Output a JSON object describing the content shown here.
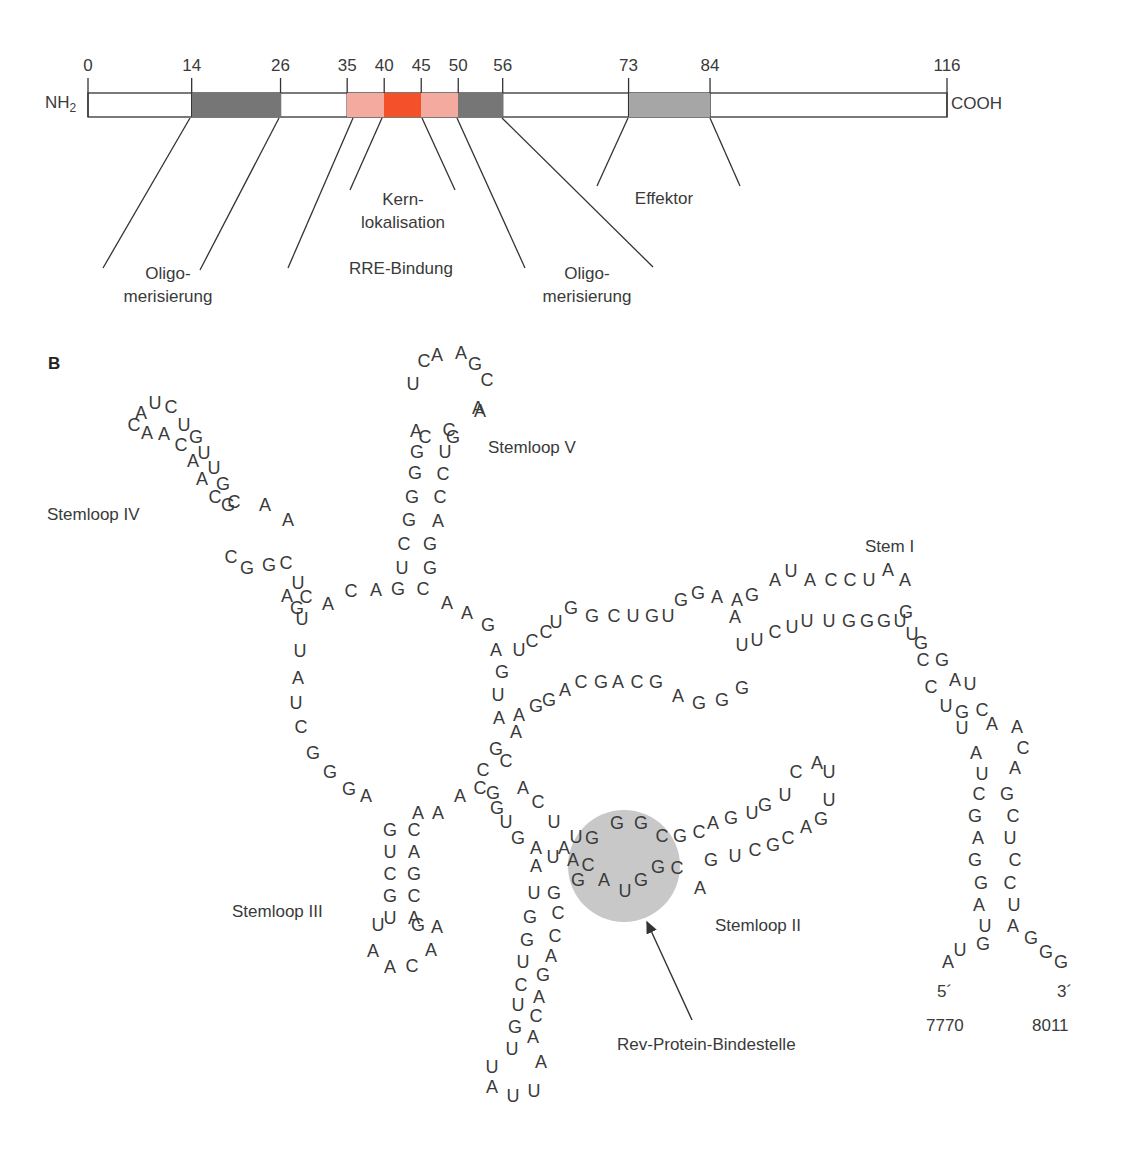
{
  "panelA": {
    "n_terminus": "NH",
    "n_terminus_sub": "2",
    "c_terminus": "COOH",
    "scale": {
      "x0": 88,
      "x116": 947,
      "max": 116
    },
    "ticks": [
      {
        "value": "0",
        "pos": 0
      },
      {
        "value": "14",
        "pos": 14
      },
      {
        "value": "26",
        "pos": 26
      },
      {
        "value": "35",
        "pos": 35
      },
      {
        "value": "40",
        "pos": 40
      },
      {
        "value": "45",
        "pos": 45
      },
      {
        "value": "50",
        "pos": 50
      },
      {
        "value": "56",
        "pos": 56
      },
      {
        "value": "73",
        "pos": 73
      },
      {
        "value": "84",
        "pos": 84
      },
      {
        "value": "116",
        "pos": 116
      }
    ],
    "segments": [
      {
        "name": "oligomerization-1",
        "start": 14,
        "end": 26,
        "color": "#767676"
      },
      {
        "name": "rre-binding-left",
        "start": 35,
        "end": 40,
        "color": "#f5aaa0"
      },
      {
        "name": "nuclear-localization",
        "start": 40,
        "end": 45,
        "color": "#f4502a"
      },
      {
        "name": "rre-binding-right",
        "start": 45,
        "end": 50,
        "color": "#f5aaa0"
      },
      {
        "name": "oligomerization-2",
        "start": 50,
        "end": 56,
        "color": "#767676"
      },
      {
        "name": "effector",
        "start": 73,
        "end": 84,
        "color": "#a6a6a6"
      }
    ],
    "labels": [
      {
        "id": "oligo1",
        "line1": "Oligo-",
        "line2": "merisierung",
        "x": 168,
        "y": 262
      },
      {
        "id": "kern",
        "line1": "Kern-",
        "line2": "lokalisation",
        "x": 403,
        "y": 188
      },
      {
        "id": "rre",
        "line1": "RRE-Bindung",
        "line2": "",
        "x": 401,
        "y": 257
      },
      {
        "id": "oligo2",
        "line1": "Oligo-",
        "line2": "merisierung",
        "x": 587,
        "y": 262
      },
      {
        "id": "effektor",
        "line1": "Effektor",
        "line2": "",
        "x": 664,
        "y": 187
      }
    ],
    "leader_lines": [
      [
        190,
        118,
        103,
        268
      ],
      [
        279,
        118,
        200,
        270
      ],
      [
        353,
        118,
        288,
        268
      ],
      [
        382,
        118,
        350,
        190
      ],
      [
        422,
        118,
        455,
        190
      ],
      [
        457,
        118,
        525,
        268
      ],
      [
        502,
        118,
        653,
        267
      ],
      [
        628,
        118,
        597,
        186
      ],
      [
        710,
        118,
        740,
        186
      ]
    ]
  },
  "panelB": {
    "letter": "B",
    "labels": [
      {
        "text": "Stemloop IV",
        "x": 47,
        "y": 505
      },
      {
        "text": "Stemloop V",
        "x": 488,
        "y": 438
      },
      {
        "text": "Stem I",
        "x": 865,
        "y": 537
      },
      {
        "text": "Stemloop III",
        "x": 232,
        "y": 902
      },
      {
        "text": "Stemloop II",
        "x": 715,
        "y": 916
      },
      {
        "text": "Rev-Protein-Bindestelle",
        "x": 617,
        "y": 1035
      },
      {
        "text": "5´",
        "x": 937,
        "y": 982
      },
      {
        "text": "3´",
        "x": 1057,
        "y": 982
      },
      {
        "text": "7770",
        "x": 926,
        "y": 1016
      },
      {
        "text": "8011",
        "x": 1032,
        "y": 1016
      }
    ],
    "binding_site": {
      "cx": 624,
      "cy": 866,
      "r": 56,
      "color": "#c8c8c8"
    },
    "arrow": {
      "x1": 692,
      "y1": 1020,
      "x2": 647,
      "y2": 922
    },
    "nucleotides": [
      [
        "A",
        141,
        413
      ],
      [
        "U",
        155,
        403
      ],
      [
        "C",
        171,
        407
      ],
      [
        "C",
        134,
        425
      ],
      [
        "A",
        147,
        433
      ],
      [
        "A",
        164,
        434
      ],
      [
        "U",
        184,
        425
      ],
      [
        "C",
        181,
        445
      ],
      [
        "G",
        196,
        437
      ],
      [
        "A",
        193,
        461
      ],
      [
        "U",
        204,
        453
      ],
      [
        "A",
        202,
        479
      ],
      [
        "U",
        214,
        468
      ],
      [
        "C",
        215,
        497
      ],
      [
        "G",
        223,
        484
      ],
      [
        "G",
        228,
        505
      ],
      [
        "C",
        234,
        502
      ],
      [
        "A",
        265,
        505
      ],
      [
        "A",
        288,
        520
      ],
      [
        "C",
        231,
        557
      ],
      [
        "G",
        247,
        568
      ],
      [
        "G",
        269,
        565
      ],
      [
        "C",
        286,
        563
      ],
      [
        "U",
        298,
        583
      ],
      [
        "A",
        287,
        596
      ],
      [
        "C",
        306,
        597
      ],
      [
        "G",
        297,
        608
      ],
      [
        "A",
        328,
        604
      ],
      [
        "U",
        302,
        619
      ],
      [
        "C",
        351,
        591
      ],
      [
        "A",
        376,
        590
      ],
      [
        "G",
        398,
        589
      ],
      [
        "C",
        423,
        589
      ],
      [
        "U",
        300,
        651
      ],
      [
        "A",
        298,
        678
      ],
      [
        "U",
        296,
        703
      ],
      [
        "C",
        301,
        727
      ],
      [
        "G",
        313,
        753
      ],
      [
        "G",
        330,
        772
      ],
      [
        "G",
        349,
        789
      ],
      [
        "A",
        366,
        796
      ],
      [
        "A",
        447,
        603
      ],
      [
        "A",
        467,
        613
      ],
      [
        "G",
        488,
        625
      ],
      [
        "A",
        496,
        650
      ],
      [
        "G",
        502,
        672
      ],
      [
        "U",
        498,
        695
      ],
      [
        "A",
        499,
        718
      ],
      [
        "U",
        402,
        568
      ],
      [
        "C",
        404,
        544
      ],
      [
        "G",
        409,
        520
      ],
      [
        "G",
        412,
        497
      ],
      [
        "G",
        415,
        473
      ],
      [
        "G",
        417,
        452
      ],
      [
        "G",
        430,
        568
      ],
      [
        "G",
        430,
        544
      ],
      [
        "A",
        438,
        521
      ],
      [
        "C",
        440,
        497
      ],
      [
        "C",
        443,
        474
      ],
      [
        "U",
        445,
        452
      ],
      [
        "C",
        449,
        430
      ],
      [
        "A",
        416,
        431
      ],
      [
        "C",
        425,
        437
      ],
      [
        "G",
        453,
        437
      ],
      [
        "A",
        480,
        411
      ],
      [
        "U",
        413,
        384
      ],
      [
        "C",
        424,
        361
      ],
      [
        "A",
        437,
        355
      ],
      [
        "A",
        461,
        353
      ],
      [
        "G",
        475,
        364
      ],
      [
        "C",
        487,
        380
      ],
      [
        "A",
        478,
        408
      ],
      [
        "U",
        519,
        650
      ],
      [
        "C",
        532,
        641
      ],
      [
        "C",
        546,
        632
      ],
      [
        "U",
        556,
        622
      ],
      [
        "G",
        571,
        608
      ],
      [
        "G",
        592,
        616
      ],
      [
        "C",
        614,
        616
      ],
      [
        "U",
        633,
        616
      ],
      [
        "G",
        652,
        616
      ],
      [
        "U",
        668,
        616
      ],
      [
        "A",
        516,
        732
      ],
      [
        "A",
        519,
        715
      ],
      [
        "G",
        536,
        706
      ],
      [
        "G",
        549,
        700
      ],
      [
        "A",
        565,
        690
      ],
      [
        "C",
        581,
        682
      ],
      [
        "G",
        601,
        682
      ],
      [
        "A",
        618,
        682
      ],
      [
        "C",
        637,
        682
      ],
      [
        "G",
        656,
        682
      ],
      [
        "A",
        678,
        696
      ],
      [
        "G",
        699,
        703
      ],
      [
        "G",
        722,
        700
      ],
      [
        "G",
        742,
        688
      ],
      [
        "G",
        681,
        600
      ],
      [
        "G",
        698,
        593
      ],
      [
        "A",
        717,
        597
      ],
      [
        "A",
        737,
        600
      ],
      [
        "G",
        752,
        595
      ],
      [
        "A",
        775,
        580
      ],
      [
        "U",
        791,
        571
      ],
      [
        "A",
        810,
        580
      ],
      [
        "C",
        831,
        580
      ],
      [
        "C",
        850,
        580
      ],
      [
        "U",
        869,
        580
      ],
      [
        "A",
        888,
        570
      ],
      [
        "A",
        905,
        580
      ],
      [
        "A",
        735,
        617
      ],
      [
        "U",
        742,
        645
      ],
      [
        "U",
        757,
        640
      ],
      [
        "C",
        775,
        632
      ],
      [
        "U",
        792,
        627
      ],
      [
        "U",
        807,
        621
      ],
      [
        "U",
        829,
        621
      ],
      [
        "G",
        849,
        621
      ],
      [
        "G",
        867,
        621
      ],
      [
        "G",
        884,
        621
      ],
      [
        "U",
        900,
        621
      ],
      [
        "G",
        906,
        612
      ],
      [
        "U",
        912,
        634
      ],
      [
        "G",
        921,
        643
      ],
      [
        "C",
        923,
        660
      ],
      [
        "G",
        942,
        660
      ],
      [
        "C",
        931,
        687
      ],
      [
        "A",
        955,
        680
      ],
      [
        "U",
        970,
        684
      ],
      [
        "U",
        946,
        706
      ],
      [
        "G",
        962,
        712
      ],
      [
        "C",
        982,
        710
      ],
      [
        "U",
        962,
        728
      ],
      [
        "A",
        992,
        724
      ],
      [
        "A",
        1017,
        727
      ],
      [
        "A",
        976,
        753
      ],
      [
        "C",
        1023,
        748
      ],
      [
        "U",
        982,
        774
      ],
      [
        "A",
        1015,
        768
      ],
      [
        "C",
        979,
        794
      ],
      [
        "G",
        1007,
        794
      ],
      [
        "G",
        975,
        816
      ],
      [
        "C",
        1013,
        816
      ],
      [
        "A",
        978,
        838
      ],
      [
        "U",
        1010,
        838
      ],
      [
        "G",
        975,
        860
      ],
      [
        "C",
        1015,
        860
      ],
      [
        "G",
        981,
        883
      ],
      [
        "C",
        1010,
        883
      ],
      [
        "A",
        979,
        905
      ],
      [
        "U",
        1014,
        905
      ],
      [
        "U",
        985,
        926
      ],
      [
        "A",
        1013,
        926
      ],
      [
        "G",
        983,
        944
      ],
      [
        "U",
        960,
        950
      ],
      [
        "A",
        948,
        962
      ],
      [
        "G",
        1031,
        938
      ],
      [
        "G",
        1046,
        952
      ],
      [
        "G",
        1061,
        962
      ],
      [
        "G",
        496,
        749
      ],
      [
        "C",
        506,
        761
      ],
      [
        "A",
        523,
        788
      ],
      [
        "C",
        538,
        802
      ],
      [
        "U",
        554,
        822
      ],
      [
        "A",
        564,
        848
      ],
      [
        "C",
        480,
        788
      ],
      [
        "G",
        497,
        808
      ],
      [
        "U",
        506,
        822
      ],
      [
        "G",
        518,
        838
      ],
      [
        "A",
        536,
        848
      ],
      [
        "U",
        553,
        857
      ],
      [
        "U",
        576,
        837
      ],
      [
        "G",
        592,
        838
      ],
      [
        "G",
        617,
        823
      ],
      [
        "G",
        641,
        823
      ],
      [
        "C",
        662,
        836
      ],
      [
        "G",
        680,
        836
      ],
      [
        "A",
        573,
        860
      ],
      [
        "C",
        588,
        865
      ],
      [
        "G",
        578,
        880
      ],
      [
        "A",
        604,
        880
      ],
      [
        "U",
        625,
        891
      ],
      [
        "G",
        641,
        880
      ],
      [
        "G",
        658,
        867
      ],
      [
        "C",
        677,
        868
      ],
      [
        "A",
        700,
        888
      ],
      [
        "C",
        699,
        832
      ],
      [
        "A",
        713,
        823
      ],
      [
        "G",
        731,
        818
      ],
      [
        "U",
        752,
        813
      ],
      [
        "G",
        765,
        805
      ],
      [
        "U",
        785,
        795
      ],
      [
        "C",
        796,
        772
      ],
      [
        "A",
        817,
        763
      ],
      [
        "U",
        829,
        772
      ],
      [
        "G",
        711,
        860
      ],
      [
        "U",
        735,
        856
      ],
      [
        "C",
        755,
        850
      ],
      [
        "G",
        773,
        845
      ],
      [
        "C",
        788,
        838
      ],
      [
        "A",
        806,
        827
      ],
      [
        "G",
        821,
        819
      ],
      [
        "U",
        829,
        800
      ],
      [
        "A",
        536,
        866
      ],
      [
        "U",
        534,
        893
      ],
      [
        "G",
        530,
        917
      ],
      [
        "G",
        527,
        940
      ],
      [
        "U",
        523,
        962
      ],
      [
        "C",
        521,
        985
      ],
      [
        "U",
        518,
        1005
      ],
      [
        "G",
        515,
        1027
      ],
      [
        "U",
        512,
        1049
      ],
      [
        "U",
        492,
        1067
      ],
      [
        "A",
        492,
        1087
      ],
      [
        "U",
        513,
        1096
      ],
      [
        "U",
        534,
        1091
      ],
      [
        "G",
        554,
        893
      ],
      [
        "C",
        558,
        913
      ],
      [
        "C",
        555,
        936
      ],
      [
        "A",
        551,
        956
      ],
      [
        "G",
        543,
        975
      ],
      [
        "A",
        539,
        997
      ],
      [
        "C",
        536,
        1016
      ],
      [
        "A",
        533,
        1037
      ],
      [
        "A",
        541,
        1062
      ],
      [
        "G",
        390,
        830
      ],
      [
        "U",
        390,
        852
      ],
      [
        "C",
        390,
        874
      ],
      [
        "G",
        390,
        896
      ],
      [
        "U",
        390,
        918
      ],
      [
        "U",
        378,
        925
      ],
      [
        "A",
        373,
        951
      ],
      [
        "A",
        390,
        967
      ],
      [
        "C",
        412,
        966
      ],
      [
        "A",
        431,
        950
      ],
      [
        "A",
        437,
        927
      ],
      [
        "C",
        414,
        830
      ],
      [
        "A",
        414,
        852
      ],
      [
        "G",
        414,
        874
      ],
      [
        "C",
        414,
        896
      ],
      [
        "A",
        414,
        918
      ],
      [
        "G",
        418,
        925
      ],
      [
        "A",
        418,
        813
      ],
      [
        "A",
        460,
        796
      ],
      [
        "A",
        438,
        813
      ],
      [
        "C",
        483,
        770
      ],
      [
        "G",
        493,
        793
      ]
    ]
  }
}
